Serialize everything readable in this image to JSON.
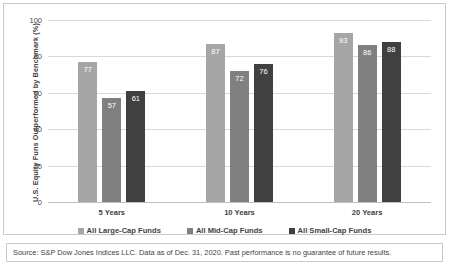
{
  "chart_data": {
    "type": "bar",
    "title": "",
    "xlabel": "",
    "ylabel": "U.S. Equity Funs Outperformed by Benchmark (%)",
    "ylim": [
      0,
      100
    ],
    "yticks": [
      0,
      20,
      40,
      60,
      80,
      100
    ],
    "grid": true,
    "legend_position": "bottom",
    "categories": [
      "5 Years",
      "10 Years",
      "20 Years"
    ],
    "series": [
      {
        "name": "All Large-Cap Funds",
        "color": "#a6a6a6",
        "values": [
          77,
          87,
          93
        ]
      },
      {
        "name": "All Mid-Cap Funds",
        "color": "#808080",
        "values": [
          57,
          72,
          86
        ]
      },
      {
        "name": "All Small-Cap Funds",
        "color": "#404040",
        "values": [
          61,
          76,
          88
        ]
      }
    ]
  },
  "source": {
    "text": "Source: S&P Dow Jones Indices LLC. Data as of Dec. 31, 2020. Past performance is no guarantee of future results."
  }
}
